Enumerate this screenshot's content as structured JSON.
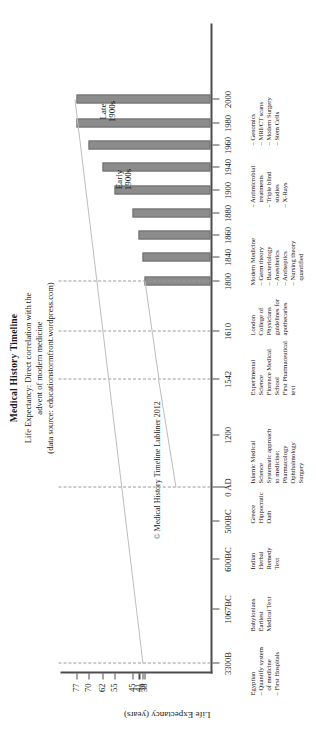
{
  "title": {
    "main": "Medical History Timeline",
    "line1": "Life Expectancy: Direct correlation with the",
    "line2": "advent of modern medicine",
    "line3": "(data source: educationstormfront.wordpress.com)"
  },
  "credit": "© Medical History Timeline Lubliner 2012",
  "axes": {
    "y_title": "Life Expectancy (years)",
    "y_ticks": [
      "77",
      "70",
      "62",
      "55",
      "45",
      "41",
      "39",
      "38"
    ],
    "x_ticks": [
      "3300B",
      "1067BC",
      "600BC",
      "500BC",
      "0 AD",
      "1200",
      "1542",
      "1610",
      "1800",
      "1840",
      "1860",
      "1880",
      "1900",
      "1940",
      "1960",
      "1980",
      "2000"
    ]
  },
  "era_labels": [
    {
      "line1": "Early",
      "line2": "1900s"
    },
    {
      "line1": "Late",
      "line2": "1900s"
    }
  ],
  "chart_data": {
    "type": "bar",
    "title": "Medical History Timeline",
    "subtitle": "Life Expectancy: Direct correlation with the advent of modern medicine",
    "source": "data source: educationstormfront.wordpress.com",
    "xlabel": "",
    "ylabel": "Life Expectancy (years)",
    "ylim": [
      0,
      80
    ],
    "grid": false,
    "legend": "none",
    "categories": [
      "3300B",
      "1067BC",
      "600BC",
      "500BC",
      "0 AD",
      "1200",
      "1542",
      "1610",
      "1800",
      "1840",
      "1860",
      "1880",
      "1900",
      "1940",
      "1960",
      "1980",
      "2000"
    ],
    "values": [
      null,
      null,
      null,
      null,
      null,
      null,
      null,
      null,
      38,
      39,
      41,
      45,
      55,
      62,
      70,
      77,
      77
    ],
    "bars": [
      {
        "year": "1800",
        "life_expectancy": 38
      },
      {
        "year": "1840",
        "life_expectancy": 39
      },
      {
        "year": "1860",
        "life_expectancy": 41
      },
      {
        "year": "1880",
        "life_expectancy": 45
      },
      {
        "year": "1900",
        "life_expectancy": 55
      },
      {
        "year": "1940",
        "life_expectancy": 62
      },
      {
        "year": "1960",
        "life_expectancy": 70
      },
      {
        "year": "1980",
        "life_expectancy": 77
      },
      {
        "year": "2000",
        "life_expectancy": 77
      }
    ],
    "ytick_values": [
      77,
      70,
      62,
      55,
      45,
      41,
      39,
      38
    ]
  },
  "annotations": [
    {
      "id": "egyptian",
      "heading": "Egyptian",
      "items": [
        "– Quantify system",
        "   of medicine",
        "– First Hospitals"
      ]
    },
    {
      "id": "babylonians",
      "heading": "Babylonians",
      "items": [
        "Earliest",
        "Medical Text"
      ]
    },
    {
      "id": "indian",
      "heading": "Indian",
      "items": [
        "Herbal",
        "Remedy",
        "Text"
      ]
    },
    {
      "id": "greece",
      "heading": "Greece",
      "items": [
        "Hippocratic",
        "Oath"
      ]
    },
    {
      "id": "islamic",
      "heading": "Islamic Medical",
      "items": [
        "Science",
        "Systematic approach",
        "to medicine:",
        "Pharmacology",
        "Ophthalmology",
        "Surgery"
      ]
    },
    {
      "id": "experimental-science",
      "heading": "Experimental",
      "items": [
        "Science",
        "Florence Medical",
        "School",
        "First Pharmaceutical",
        "text"
      ]
    },
    {
      "id": "london-college",
      "heading": "London",
      "items": [
        "College of",
        "Physicians",
        "guidelines for",
        "apothecaries"
      ]
    },
    {
      "id": "modern-medicine",
      "heading": "Modern Medicine",
      "items": [
        "– Germ theory",
        "– Bacteriology",
        "– Anesthetics",
        "– Antiseptics",
        "– Nursing theory",
        "   quantified"
      ]
    },
    {
      "id": "antimicrobial",
      "heading": "– Antimicrobial",
      "items": [
        "   treatments",
        "– Triple blind",
        "   studies",
        "– X-Rays"
      ]
    },
    {
      "id": "genomics",
      "heading": "– Genomics",
      "items": [
        "– MRI/CT scans",
        "– Modern Surgery",
        "– Stem Cells"
      ]
    }
  ],
  "colors": {
    "bar_fill": "#8c8c8c",
    "axis": "#4d4d4d",
    "trend_line": "#bdbdbd",
    "guide_line": "#9a9a9a",
    "text": "#1a1a1a"
  }
}
